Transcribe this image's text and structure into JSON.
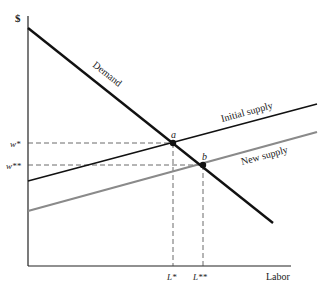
{
  "diagram": {
    "type": "labor market supply shift",
    "y_axis_label": "$",
    "x_axis_label": "Labor",
    "curves": {
      "demand": {
        "label": "Demand",
        "color": "#111111"
      },
      "initial_supply": {
        "label": "Initial supply",
        "color": "#111111"
      },
      "new_supply": {
        "label": "New supply",
        "color": "#8a8a8a"
      }
    },
    "points": {
      "a": {
        "label": "a"
      },
      "b": {
        "label": "b"
      }
    },
    "wage_labels": {
      "w_star": "w*",
      "w_star_star": "w**"
    },
    "labor_labels": {
      "l_star": "L*",
      "l_star_star": "L**"
    }
  }
}
